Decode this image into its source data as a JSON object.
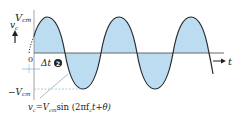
{
  "diagram": {
    "type": "sinusoid-waveform",
    "labels": {
      "vcm_top": "V",
      "vcm_top_sub": "cm",
      "vc": "v",
      "vc_sub": "c",
      "origin": "0",
      "delta_t": "Δt",
      "marker": "2",
      "vcm_bottom": "−V",
      "vcm_bottom_sub": "cm",
      "t_axis": "t",
      "equation": "v",
      "equation_sub": "c",
      "equation_rest": "=V",
      "equation_rest_sub": "cm",
      "equation_tail": "sin (2πf",
      "equation_tail_sub": "c",
      "equation_end": "t+θ)"
    },
    "colors": {
      "fill": "#bcdcf2",
      "curve": "#2a2a2a",
      "axis": "#444444",
      "dashed": "#88b8d8"
    }
  }
}
